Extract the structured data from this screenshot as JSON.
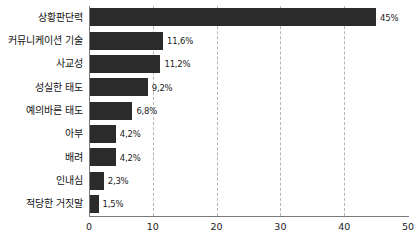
{
  "chart_data": {
    "type": "bar",
    "orientation": "horizontal",
    "title": "",
    "xlabel": "",
    "ylabel": "",
    "xlim": [
      0,
      50
    ],
    "xticks": [
      0,
      10,
      20,
      30,
      40,
      50
    ],
    "xtick_labels": [
      "0",
      "10",
      "20",
      "30",
      "40",
      "50"
    ],
    "grid": true,
    "gridlines_at": [
      10,
      20,
      30,
      40
    ],
    "legend": null,
    "bar_color": "#2b2b2b",
    "categories": [
      "상황판단력",
      "커뮤니케이션 기술",
      "사교성",
      "성실한 태도",
      "예의바른 태도",
      "아부",
      "배려",
      "인내심",
      "적당한 거짓말"
    ],
    "values": [
      45,
      11.6,
      11.2,
      9.2,
      6.8,
      4.2,
      4.2,
      2.3,
      1.5
    ],
    "value_labels": [
      "45%",
      "11,6%",
      "11,2%",
      "9,2%",
      "6,8%",
      "4,2%",
      "4,2%",
      "2,3%",
      "1,5%"
    ]
  }
}
